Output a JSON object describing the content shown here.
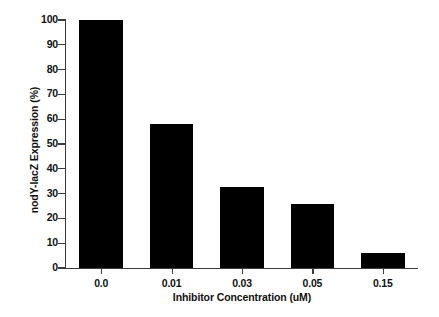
{
  "chart_data": {
    "type": "bar",
    "title": "",
    "xlabel": "Inhibitor Concentration (uM)",
    "ylabel": "nodY-lacZ Expression (%)",
    "categories": [
      "0.0",
      "0.01",
      "0.03",
      "0.05",
      "0.15"
    ],
    "values": [
      100,
      58,
      32.5,
      26,
      6
    ],
    "ylim": [
      0,
      100
    ],
    "yticks": [
      0,
      10,
      20,
      30,
      40,
      50,
      60,
      70,
      80,
      90,
      100
    ],
    "ytick_labels": [
      "0",
      "10",
      "20",
      "30",
      "40",
      "50",
      "60",
      "70",
      "80",
      "90",
      "100"
    ],
    "grid": false,
    "legend": false,
    "bar_color": "#000000",
    "axis_color": "#3b3b3b",
    "background_color": "#ffffff"
  }
}
